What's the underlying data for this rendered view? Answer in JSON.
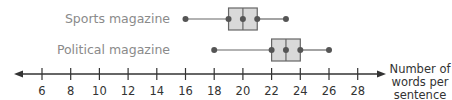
{
  "chart_data": {
    "type": "boxplot",
    "title": "",
    "xlabel": "Number of words per sentence",
    "xlabel_lines": [
      "Number of",
      "words per",
      "sentence"
    ],
    "ylabel": "",
    "x_ticks": [
      6,
      8,
      10,
      12,
      14,
      16,
      18,
      20,
      22,
      24,
      26,
      28
    ],
    "xlim": [
      4.5,
      29.5
    ],
    "grid": false,
    "series": [
      {
        "name": "Sports magazine",
        "min": 16,
        "q1": 19,
        "median": 20,
        "q3": 21,
        "max": 23
      },
      {
        "name": "Political magazine",
        "min": 18,
        "q1": 22,
        "median": 23,
        "q3": 24,
        "max": 26
      }
    ],
    "colors": {
      "box_fill": "#d9d9d9",
      "stroke": "#666666",
      "axis": "#333333",
      "label": "#8a8a8a"
    }
  }
}
